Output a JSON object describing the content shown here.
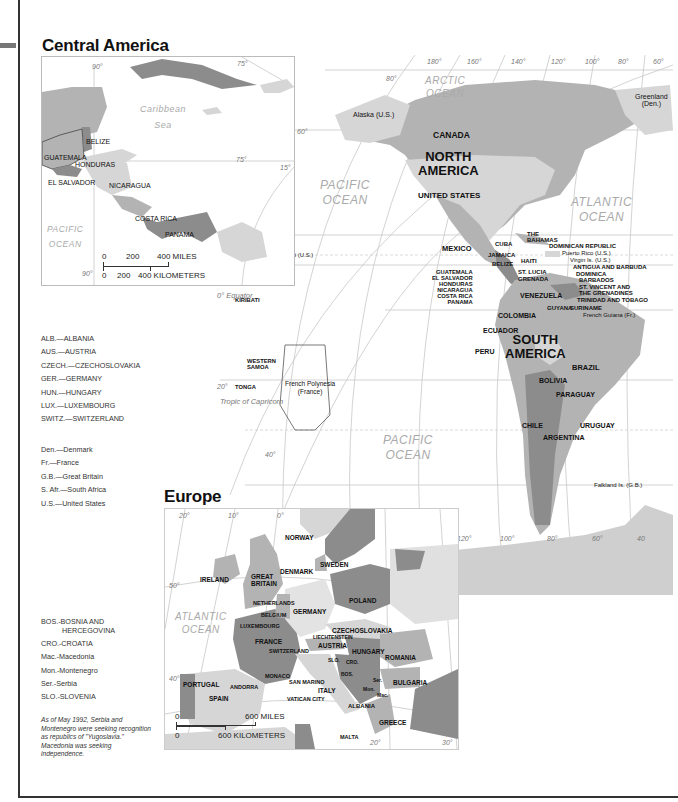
{
  "page": {
    "sections": {
      "central_america_title": "Central America",
      "europe_title": "Europe"
    }
  },
  "central_america": {
    "degrees": {
      "lon90_top": "90°",
      "lon75_top": "75°",
      "lat15": "15°",
      "lon90_bottom": "90°",
      "lon75_right": "75°"
    },
    "water": {
      "caribbean_line1": "Caribbean",
      "caribbean_line2": "Sea",
      "pacific_line1": "PACIFIC",
      "pacific_line2": "OCEAN"
    },
    "countries": [
      "BELIZE",
      "GUATEMALA",
      "HONDURAS",
      "EL SALVADOR",
      "NICARAGUA",
      "COSTA RICA",
      "PANAMA"
    ],
    "scale": {
      "miles_0": "0",
      "miles_200": "200",
      "miles_400": "400 MILES",
      "km_0": "0",
      "km_200": "200",
      "km_400": "400 KILOMETERS"
    }
  },
  "world_map": {
    "longitudes": [
      "180°",
      "160°",
      "140°",
      "120°",
      "100°",
      "80°",
      "60°"
    ],
    "latitudes": {
      "lat80": "80°",
      "lat60": "60°",
      "lat40": "40°",
      "lat20": "20°",
      "equator": "0° Equator",
      "lat20s": "20°",
      "lat40s": "40°",
      "lat60s": "60°",
      "lat80s": "80°"
    },
    "tropic_cancer": "Tropic of Cancer",
    "tropic_capricorn": "Tropic of Capricorn",
    "antarctic_circle": "Antarctic Circle",
    "bottom_longitudes": [
      "180°",
      "160°",
      "140°",
      "120°",
      "100°",
      "80°",
      "60°",
      "40"
    ],
    "oceans": {
      "arctic_line1": "ARCTIC",
      "arctic_line2": "OCEAN",
      "pacific_n_line1": "PACIFIC",
      "pacific_n_line2": "OCEAN",
      "atlantic_line1": "ATLANTIC",
      "atlantic_line2": "OCEAN",
      "pacific_s_line1": "PACIFIC",
      "pacific_s_line2": "OCEAN"
    },
    "continents": {
      "north_america_line1": "NORTH",
      "north_america_line2": "AMERICA",
      "south_america_line1": "SOUTH",
      "south_america_line2": "AMERICA"
    },
    "places": {
      "alaska": "Alaska (U.S.)",
      "greenland_line1": "Greenland",
      "greenland_line2": "(Den.)",
      "canada": "CANADA",
      "united_states": "UNITED STATES",
      "mexico": "MEXICO",
      "cuba": "CUBA",
      "bahamas_line1": "THE",
      "bahamas_line2": "BAHAMAS",
      "jamaica": "JAMAICA",
      "haiti": "HAITI",
      "belize": "BELIZE",
      "dominican_republic": "DOMINICAN REPUBLIC",
      "puerto_rico": "Puerto Rico (U.S.)",
      "virgin_islands": "Virgin Is. (U.S.)",
      "antigua": "ANTIGUA AND BARBUDA",
      "dominica": "DOMINICA",
      "st_lucia": "ST. LUCIA",
      "barbados": "BARBADOS",
      "grenada": "GRENADA",
      "st_vincent_line1": "ST. VINCENT AND",
      "st_vincent_line2": "THE GRENADINES",
      "trinidad": "TRINIDAD AND TOBAGO",
      "guatemala": "GUATEMALA",
      "el_salvador": "EL SALVADOR",
      "honduras": "HONDURAS",
      "nicaragua": "NICARAGUA",
      "costa_rica": "COSTA RICA",
      "panama": "PANAMA",
      "venezuela": "VENEZUELA",
      "guyana": "GUYANA",
      "suriname": "SURINAME",
      "french_guiana": "French Guiana (Fr.)",
      "colombia": "COLOMBIA",
      "ecuador": "ECUADOR",
      "peru": "PERU",
      "brazil": "BRAZIL",
      "bolivia": "BOLIVIA",
      "paraguay": "PARAGUAY",
      "chile": "CHILE",
      "argentina": "ARGENTINA",
      "uruguay": "URUGUAY",
      "falkland": "Falkland Is. (G.B.)",
      "midway": "Midway Is. (U.S.)",
      "hawaii": "Hawaii (U.S.)",
      "kiribati": "KIRIBATI",
      "western_samoa_line1": "WESTERN",
      "western_samoa_line2": "SAMOA",
      "tonga": "TONGA",
      "french_polynesia_line1": "French Polynesia",
      "french_polynesia_line2": "(France)"
    }
  },
  "europe": {
    "degrees": {
      "lon20w": "20°",
      "lon10w": "10°",
      "lon0": "0°",
      "lat50": "50°",
      "lat40": "40°",
      "lon20e": "20°",
      "lon30e": "30°"
    },
    "water": {
      "atlantic_line1": "ATLANTIC",
      "atlantic_line2": "OCEAN"
    },
    "countries": {
      "norway": "NORWAY",
      "sweden": "SWEDEN",
      "denmark": "DENMARK",
      "ireland": "IRELAND",
      "great_britain_line1": "GREAT",
      "great_britain_line2": "BRITAIN",
      "netherlands": "NETHERLANDS",
      "belgium": "BELGIUM",
      "luxembourg": "LUXEMBOURG",
      "germany": "GERMANY",
      "poland": "POLAND",
      "czechoslovakia": "CZECHOSLOVAKIA",
      "liechtenstein": "LIECHTENSTEIN",
      "france": "FRANCE",
      "switzerland": "SWITZERLAND",
      "austria": "AUSTRIA",
      "hungary": "HUNGARY",
      "romania": "ROMANIA",
      "slo": "SLO.",
      "cro": "CRO.",
      "bos": "BOS.",
      "ser": "Ser.",
      "mon": "Mon.",
      "mac": "Mac.",
      "bulgaria": "BULGARIA",
      "monaco": "MONACO",
      "portugal": "PORTUGAL",
      "andorra": "ANDORRA",
      "spain": "SPAIN",
      "san_marino": "SAN MARINO",
      "italy": "ITALY",
      "vatican": "VATICAN CITY",
      "albania": "ALBANIA",
      "greece": "GREECE",
      "malta": "MALTA"
    },
    "scale": {
      "miles_0": "0",
      "miles_600": "600 MILES",
      "km_0": "0",
      "km_600": "600 KILOMETERS"
    }
  },
  "legend": {
    "countries_upper": [
      "ALB.—ALBANIA",
      "AUS.—AUSTRIA",
      "CZECH.—CZECHOSLOVAKIA",
      "GER.—GERMANY",
      "HUN.—HUNGARY",
      "LUX.—LUXEMBOURG",
      "SWITZ.—SWITZERLAND"
    ],
    "countries_lower": [
      "Den.—Denmark",
      "Fr.—France",
      "G.B.—Great Britain",
      "S. Afr.—South Africa",
      "U.S.—United States"
    ],
    "yugoslav": [
      "BOS.-BOSNIA  AND",
      "HERCEGOVINA",
      "CRO.-CROATIA",
      "Mac.-Macedonia",
      "Mon.-Montenegro",
      "Ser.-Serbia",
      "SLO.-SLOVENIA"
    ],
    "note": "As of May 1992, Serbia and Montenegro were seeking recognition as republics of \"Yugoslavia.\"  Macedonia was seeking independence."
  },
  "colors": {
    "land_light": "#d6d6d6",
    "land_mid": "#b3b3b3",
    "land_dark": "#8c8c8c",
    "grid": "#c8c8c8",
    "ocean_label": "#aaaaaa"
  }
}
